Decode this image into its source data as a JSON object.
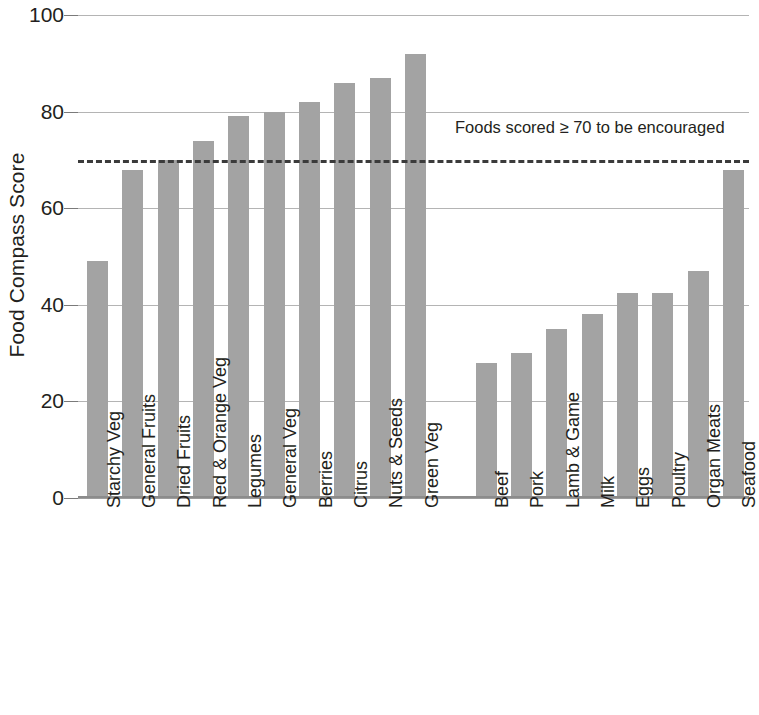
{
  "chart_data": {
    "type": "bar",
    "title": "",
    "subtitle": "",
    "xlabel": "",
    "ylabel": "Food Compass Score",
    "ylim": [
      0,
      100
    ],
    "yticks": [
      0,
      20,
      40,
      60,
      80,
      100
    ],
    "ytick_labels": [
      "0",
      "20",
      "40",
      "60",
      "80",
      "100"
    ],
    "grid": true,
    "legend": null,
    "bar_color": "#a3a3a3",
    "categories": [
      "Starchy Veg",
      "General Fruits",
      "Dried Fruits",
      "Red & Orange Veg",
      "Legumes",
      "General Veg",
      "Berries",
      "Citrus",
      "Nuts & Seeds",
      "Green Veg",
      "Beef",
      "Pork",
      "Lamb & Game",
      "Milk",
      "Eggs",
      "Poultry",
      "Organ Meats",
      "Seafood"
    ],
    "values": [
      49,
      68,
      70,
      74,
      79,
      80,
      82,
      86,
      87,
      92,
      28,
      30,
      35,
      38,
      42.5,
      42.5,
      47,
      68
    ],
    "group_break_after_index": 9,
    "annotations": [
      {
        "text": "Foods scored ≥ 70 to be encouraged",
        "value": 70,
        "line_style": "dashed",
        "line_color": "#3b3b3b"
      }
    ]
  },
  "axis": {
    "y_title": "Food Compass Score"
  },
  "threshold": {
    "note": "Foods scored ≥ 70 to be encouraged",
    "value": 70
  }
}
